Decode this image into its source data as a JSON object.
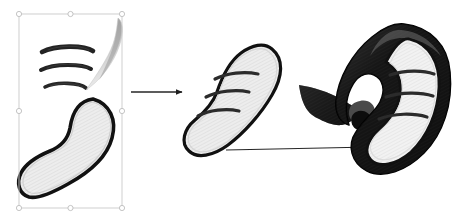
{
  "document": {
    "title": "Shape Construction Diagram",
    "background_color": "#ffffff",
    "width": 467,
    "height": 222,
    "stage_count": 3
  },
  "palette": {
    "outline": "#111111",
    "shape_fill_light": "#ededed",
    "shape_fill_lighter": "#f5f5f5",
    "shape_fill_mid": "#d2d2d2",
    "dark_band": "#151515",
    "dark_band_soft": "#2a2a2a",
    "stripe": "#2b2b2b",
    "gray_sliver": "#b9b9b9",
    "gray_sliver_dark": "#8e8e8e",
    "arrow": "#262626",
    "selection_line": "#c9c9c9",
    "selection_handle_fill": "#ffffff",
    "selection_handle_stroke": "#bdbdbd"
  },
  "selection": {
    "label": "selection-bounding-box",
    "x": 19,
    "y": 14,
    "width": 103,
    "height": 194,
    "handle_count": 8,
    "handle_radius": 2.6,
    "handles": [
      {
        "name": "handle-top-left",
        "x": 19,
        "y": 14
      },
      {
        "name": "handle-top-center",
        "x": 70.5,
        "y": 14
      },
      {
        "name": "handle-top-right",
        "x": 122,
        "y": 14
      },
      {
        "name": "handle-middle-left",
        "x": 19,
        "y": 111
      },
      {
        "name": "handle-middle-right",
        "x": 122,
        "y": 111
      },
      {
        "name": "handle-bottom-left",
        "x": 19,
        "y": 208
      },
      {
        "name": "handle-bottom-center",
        "x": 70.5,
        "y": 208
      },
      {
        "name": "handle-bottom-right",
        "x": 122,
        "y": 208
      }
    ]
  },
  "stage1": {
    "name": "stage-1-components",
    "description": "Selected source parts: three curved stroke arcs, a tapered gray sliver, and a large hatched blob",
    "arcs": [
      {
        "name": "arc-stroke-top",
        "d": "M42,52 C55,45 84,45 93,51",
        "width": 4.6
      },
      {
        "name": "arc-stroke-middle",
        "d": "M41,70 C54,63 83,64 91,69",
        "width": 4.0
      },
      {
        "name": "arc-stroke-bottom",
        "d": "M45,87 C57,81 80,83 86,88",
        "width": 3.6
      }
    ],
    "sliver": {
      "name": "tapered-gray-sliver",
      "d": "M118,18 C124,22 124,36 117,52 C110,68 98,82 86,90 C96,76 108,58 113,44 C117,32 117,24 118,18 Z"
    },
    "blob": {
      "name": "hatched-blob-shape",
      "d": "M93,99 C110,104 117,120 112,138 C107,157 90,172 68,184 C52,193 37,199 29,197 C19,194 16,183 21,173 C26,163 38,156 50,151 C62,146 68,139 70,128 C72,114 78,101 93,99 Z",
      "stroke_width": 3.6,
      "fill": "#ededed"
    }
  },
  "stage2": {
    "name": "stage-2-merged-shape",
    "description": "Unified curved blob with three banding stripes",
    "blob": {
      "name": "merged-blob-shape",
      "d": "M272,49 C284,59 283,76 272,95 C261,114 244,133 228,145 C213,156 197,159 189,151 C180,143 184,129 195,120 C206,111 213,103 217,92 C222,77 229,62 241,53 C252,45 264,42 272,49 Z",
      "stroke_width": 3.2,
      "fill": "#ededed"
    },
    "stripes": [
      {
        "name": "stripe-1",
        "d": "M215,79 C227,73 244,71 258,74",
        "width": 3.2
      },
      {
        "name": "stripe-2",
        "d": "M206,97 C218,91 236,89 249,92",
        "width": 3.2
      },
      {
        "name": "stripe-3",
        "d": "M198,116 C209,110 226,108 239,111",
        "width": 3.2
      }
    ]
  },
  "stage3": {
    "name": "stage-3-final-form",
    "description": "Final hooked form with dark outer band, light striped interior and a dark swooping tail",
    "tail": {
      "name": "swooping-dark-tail",
      "d": "M300,86 C314,88 330,93 342,100 C351,105 357,110 362,110 C356,117 349,123 342,124 C334,125 326,121 318,117 C310,113 303,108 300,86 Z"
    },
    "hook_band": {
      "name": "dark-outer-band",
      "d": "M404,24 C430,27 447,45 449,72 C452,104 442,134 423,153 C405,171 382,178 367,170 C352,162 348,145 356,132 C363,119 374,113 379,103 C385,91 382,80 373,76 C364,72 355,78 350,88 C344,99 344,113 348,124 C341,122 335,114 336,102 C338,80 352,54 372,38 C383,29 394,23 404,24 Z"
    },
    "inner": {
      "name": "light-striped-interior",
      "d": "M408,40 C428,44 438,62 437,86 C436,112 426,136 410,151 C396,164 379,167 371,159 C364,152 368,141 377,133 C389,122 397,110 399,96 C401,80 395,68 385,63 C392,50 400,39 408,40 Z",
      "fill": "#ededed"
    },
    "stripes": [
      {
        "name": "stripe-1",
        "d": "M390,75 C405,70 423,70 434,74",
        "width": 3.2
      },
      {
        "name": "stripe-2",
        "d": "M386,97 C401,92 421,92 433,96",
        "width": 3.2
      },
      {
        "name": "stripe-3",
        "d": "M379,119 C394,113 414,113 427,117",
        "width": 3.2
      }
    ]
  },
  "arrows": [
    {
      "name": "arrow-stage1-to-stage2",
      "x1": 131,
      "y1": 92,
      "x2": 188,
      "y2": 92,
      "stroke_width": 1.4,
      "head_size": 6
    },
    {
      "name": "arrow-stage2-to-stage3",
      "x1": 226,
      "y1": 150,
      "x2": 377,
      "y2": 147,
      "stroke_width": 1.2,
      "head_size": 6
    }
  ]
}
